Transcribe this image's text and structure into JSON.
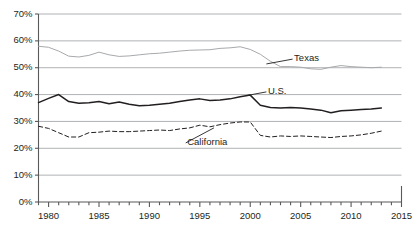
{
  "chart_data": {
    "type": "line",
    "title": "",
    "subtitle": "",
    "xlabel": "",
    "ylabel": "",
    "xlim": [
      1979,
      2015
    ],
    "ylim": [
      0,
      70
    ],
    "grid": "horizontal",
    "legend_position": "inline-annotations",
    "y_ticks": [
      "0%",
      "10%",
      "20%",
      "30%",
      "40%",
      "50%",
      "60%",
      "70%"
    ],
    "y_tick_values": [
      0,
      10,
      20,
      30,
      40,
      50,
      60,
      70
    ],
    "x_ticks": [
      "1980",
      "1985",
      "1990",
      "1995",
      "2000",
      "2005",
      "2010",
      "2015"
    ],
    "x_tick_values": [
      1980,
      1985,
      1990,
      1995,
      2000,
      2005,
      2010,
      2015
    ],
    "x_minor_tick_interval": 1,
    "x": [
      1979,
      1980,
      1981,
      1982,
      1983,
      1984,
      1985,
      1986,
      1987,
      1988,
      1989,
      1990,
      1991,
      1992,
      1993,
      1994,
      1995,
      1996,
      1997,
      1998,
      1999,
      2000,
      2001,
      2002,
      2003,
      2004,
      2005,
      2006,
      2007,
      2008,
      2009,
      2010,
      2011,
      2012,
      2013
    ],
    "series": [
      {
        "name": "Texas",
        "color": "#a7a9ac",
        "style": "solid",
        "width": 1,
        "values": [
          58.0,
          57.6,
          56.2,
          54.3,
          54.0,
          54.6,
          55.8,
          54.8,
          54.2,
          54.4,
          54.8,
          55.2,
          55.4,
          55.8,
          56.2,
          56.5,
          56.6,
          56.7,
          57.2,
          57.4,
          57.8,
          56.8,
          55.0,
          52.4,
          50.4,
          50.4,
          50.2,
          49.6,
          49.4,
          50.2,
          50.8,
          50.4,
          50.2,
          50.0,
          50.2
        ]
      },
      {
        "name": "U.S.",
        "color": "#231f20",
        "style": "solid",
        "width": 1.5,
        "values": [
          37.0,
          38.6,
          40.0,
          37.4,
          36.8,
          37.0,
          37.4,
          36.6,
          37.2,
          36.4,
          35.8,
          36.0,
          36.4,
          36.8,
          37.4,
          38.0,
          38.4,
          37.8,
          38.0,
          38.4,
          39.2,
          39.8,
          36.0,
          35.2,
          35.0,
          35.2,
          35.0,
          34.6,
          34.2,
          33.2,
          34.0,
          34.2,
          34.4,
          34.6,
          35.0
        ]
      },
      {
        "name": "California",
        "color": "#231f20",
        "style": "dashed",
        "width": 1,
        "values": [
          28.2,
          27.4,
          25.8,
          24.2,
          24.2,
          25.8,
          26.0,
          26.4,
          26.2,
          26.2,
          26.4,
          26.6,
          26.8,
          26.6,
          27.2,
          27.6,
          28.6,
          28.0,
          28.8,
          29.4,
          29.8,
          29.8,
          24.8,
          24.2,
          24.6,
          24.4,
          24.6,
          24.4,
          24.2,
          24.0,
          24.4,
          24.6,
          25.0,
          25.6,
          26.4
        ]
      }
    ],
    "annotations": [
      {
        "label": "Texas",
        "x": 2004.2,
        "y": 53.2,
        "leader_to_x": 2001.6,
        "leader_to_y": 51.4
      },
      {
        "label": "U.S.",
        "x": 2001.6,
        "y": 41.0,
        "leader_to_x": 1999.6,
        "leader_to_y": 39.6
      },
      {
        "label": "California",
        "x": 1993.6,
        "y": 22.0,
        "leader_to_x": 1996.4,
        "leader_to_y": 27.6
      }
    ]
  }
}
